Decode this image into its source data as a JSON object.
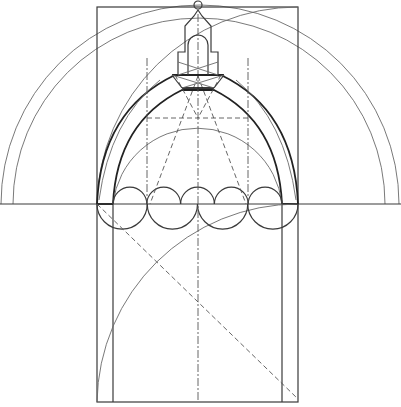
{
  "diagram": {
    "elements": [
      "outer-rectangle",
      "inner-vertical-lines",
      "baseline",
      "large-outer-semicircle",
      "large-inner-semicircle",
      "outer-pointed-arch",
      "inner-pointed-arch",
      "round-inner-arch",
      "upper-semicircle-row",
      "lower-semicircle-row",
      "quarter-arc-upper",
      "quarter-arc-lower",
      "diagonal-dashed-line",
      "construction-dashed-lines",
      "center-axis",
      "lantern",
      "finial-ball"
    ],
    "counts": {
      "upper_semicircles": 5,
      "lower_semicircles": 4
    }
  }
}
